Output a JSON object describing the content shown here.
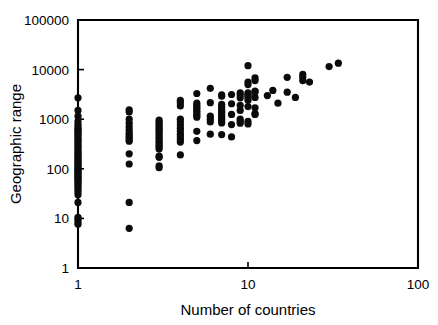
{
  "figure": {
    "title": "",
    "background_color": "#ffffff",
    "foreground_color": "#000000"
  },
  "axes": {
    "x_label": "Number of countries",
    "y_label": "Geographic range",
    "x_ticks": [
      "1",
      "10",
      "100"
    ],
    "y_ticks": [
      "1",
      "10",
      "100",
      "1000",
      "10000",
      "100000"
    ]
  },
  "chart_data": {
    "type": "scatter",
    "title": "",
    "xlabel": "Number of countries",
    "ylabel": "Geographic range",
    "xscale": "log",
    "yscale": "log",
    "xlim": [
      1,
      100
    ],
    "ylim": [
      1,
      100000
    ],
    "xticks": [
      1,
      10,
      100
    ],
    "xticklabels": [
      "1",
      "10",
      "100"
    ],
    "yticks": [
      1,
      10,
      100,
      1000,
      10000,
      100000
    ],
    "yticklabels": [
      "1",
      "10",
      "100",
      "1000",
      "10000",
      "100000"
    ],
    "grid": false,
    "legend": false,
    "marker": "filled-circle",
    "marker_color": "#000000",
    "series": [
      {
        "name": "species",
        "points": [
          [
            1,
            2700
          ],
          [
            1,
            1500
          ],
          [
            1,
            1150
          ],
          [
            1,
            900
          ],
          [
            1,
            780
          ],
          [
            1,
            700
          ],
          [
            1,
            640
          ],
          [
            1,
            600
          ],
          [
            1,
            560
          ],
          [
            1,
            520
          ],
          [
            1,
            480
          ],
          [
            1,
            440
          ],
          [
            1,
            400
          ],
          [
            1,
            370
          ],
          [
            1,
            340
          ],
          [
            1,
            310
          ],
          [
            1,
            285
          ],
          [
            1,
            260
          ],
          [
            1,
            235
          ],
          [
            1,
            215
          ],
          [
            1,
            200
          ],
          [
            1,
            185
          ],
          [
            1,
            170
          ],
          [
            1,
            158
          ],
          [
            1,
            146
          ],
          [
            1,
            135
          ],
          [
            1,
            126
          ],
          [
            1,
            118
          ],
          [
            1,
            110
          ],
          [
            1,
            103
          ],
          [
            1,
            97
          ],
          [
            1,
            91
          ],
          [
            1,
            85
          ],
          [
            1,
            80
          ],
          [
            1,
            75
          ],
          [
            1,
            70
          ],
          [
            1,
            66
          ],
          [
            1,
            62
          ],
          [
            1,
            58
          ],
          [
            1,
            54
          ],
          [
            1,
            50
          ],
          [
            1,
            46
          ],
          [
            1,
            42
          ],
          [
            1,
            38
          ],
          [
            1,
            34
          ],
          [
            1,
            30
          ],
          [
            1,
            21
          ],
          [
            1,
            10.5
          ],
          [
            1,
            9.5
          ],
          [
            1,
            8.5
          ],
          [
            1,
            7.6
          ],
          [
            2,
            1550
          ],
          [
            2,
            1400
          ],
          [
            2,
            1000
          ],
          [
            2,
            830
          ],
          [
            2,
            700
          ],
          [
            2,
            600
          ],
          [
            2,
            520
          ],
          [
            2,
            470
          ],
          [
            2,
            430
          ],
          [
            2,
            390
          ],
          [
            2,
            360
          ],
          [
            2,
            200
          ],
          [
            2,
            125
          ],
          [
            2,
            21
          ],
          [
            2,
            6.3
          ],
          [
            3,
            960
          ],
          [
            3,
            870
          ],
          [
            3,
            790
          ],
          [
            3,
            720
          ],
          [
            3,
            660
          ],
          [
            3,
            600
          ],
          [
            3,
            540
          ],
          [
            3,
            490
          ],
          [
            3,
            440
          ],
          [
            3,
            400
          ],
          [
            3,
            360
          ],
          [
            3,
            330
          ],
          [
            3,
            300
          ],
          [
            3,
            275
          ],
          [
            3,
            250
          ],
          [
            3,
            180
          ],
          [
            3,
            170
          ],
          [
            3,
            115
          ],
          [
            3,
            105
          ],
          [
            4,
            2400
          ],
          [
            4,
            2150
          ],
          [
            4,
            1850
          ],
          [
            4,
            1000
          ],
          [
            4,
            880
          ],
          [
            4,
            760
          ],
          [
            4,
            660
          ],
          [
            4,
            580
          ],
          [
            4,
            500
          ],
          [
            4,
            440
          ],
          [
            4,
            390
          ],
          [
            4,
            345
          ],
          [
            4,
            190
          ],
          [
            5,
            3300
          ],
          [
            5,
            2100
          ],
          [
            5,
            1900
          ],
          [
            5,
            1750
          ],
          [
            5,
            1600
          ],
          [
            5,
            1450
          ],
          [
            5,
            1320
          ],
          [
            5,
            1200
          ],
          [
            5,
            1100
          ],
          [
            5,
            570
          ],
          [
            5,
            370
          ],
          [
            6,
            4200
          ],
          [
            6,
            2150
          ],
          [
            6,
            1150
          ],
          [
            6,
            1000
          ],
          [
            6,
            880
          ],
          [
            6,
            500
          ],
          [
            7,
            3100
          ],
          [
            7,
            2900
          ],
          [
            7,
            2000
          ],
          [
            7,
            1800
          ],
          [
            7,
            1620
          ],
          [
            7,
            1480
          ],
          [
            7,
            1350
          ],
          [
            7,
            1230
          ],
          [
            7,
            1120
          ],
          [
            7,
            1020
          ],
          [
            7,
            930
          ],
          [
            7,
            840
          ],
          [
            7,
            490
          ],
          [
            8,
            3150
          ],
          [
            8,
            2050
          ],
          [
            8,
            1250
          ],
          [
            8,
            780
          ],
          [
            8,
            440
          ],
          [
            9,
            3400
          ],
          [
            9,
            3100
          ],
          [
            9,
            2700
          ],
          [
            9,
            1900
          ],
          [
            9,
            1500
          ],
          [
            9,
            1000
          ],
          [
            9,
            900
          ],
          [
            9,
            830
          ],
          [
            10,
            12000
          ],
          [
            10,
            5600
          ],
          [
            10,
            5000
          ],
          [
            10,
            3400
          ],
          [
            10,
            3150
          ],
          [
            10,
            2950
          ],
          [
            10,
            2700
          ],
          [
            10,
            2400
          ],
          [
            10,
            1800
          ],
          [
            10,
            900
          ],
          [
            10,
            800
          ],
          [
            11,
            6800
          ],
          [
            11,
            6000
          ],
          [
            11,
            3700
          ],
          [
            11,
            3550
          ],
          [
            11,
            2750
          ],
          [
            11,
            1700
          ],
          [
            11,
            1300
          ],
          [
            11,
            1250
          ],
          [
            13,
            3000
          ],
          [
            14,
            3800
          ],
          [
            15,
            2100
          ],
          [
            17,
            7000
          ],
          [
            17,
            3500
          ],
          [
            19,
            2750
          ],
          [
            21,
            8000
          ],
          [
            21,
            7000
          ],
          [
            21,
            6000
          ],
          [
            23,
            5600
          ],
          [
            30,
            11500
          ],
          [
            34,
            13500
          ]
        ]
      }
    ]
  },
  "geometry": {
    "plot_left_px": 78,
    "plot_right_px": 418,
    "plot_top_px": 20,
    "plot_bottom_px": 268,
    "x_decade_px": 170,
    "y_decade_px": 49.6,
    "marker_radius_px": 3.6
  }
}
